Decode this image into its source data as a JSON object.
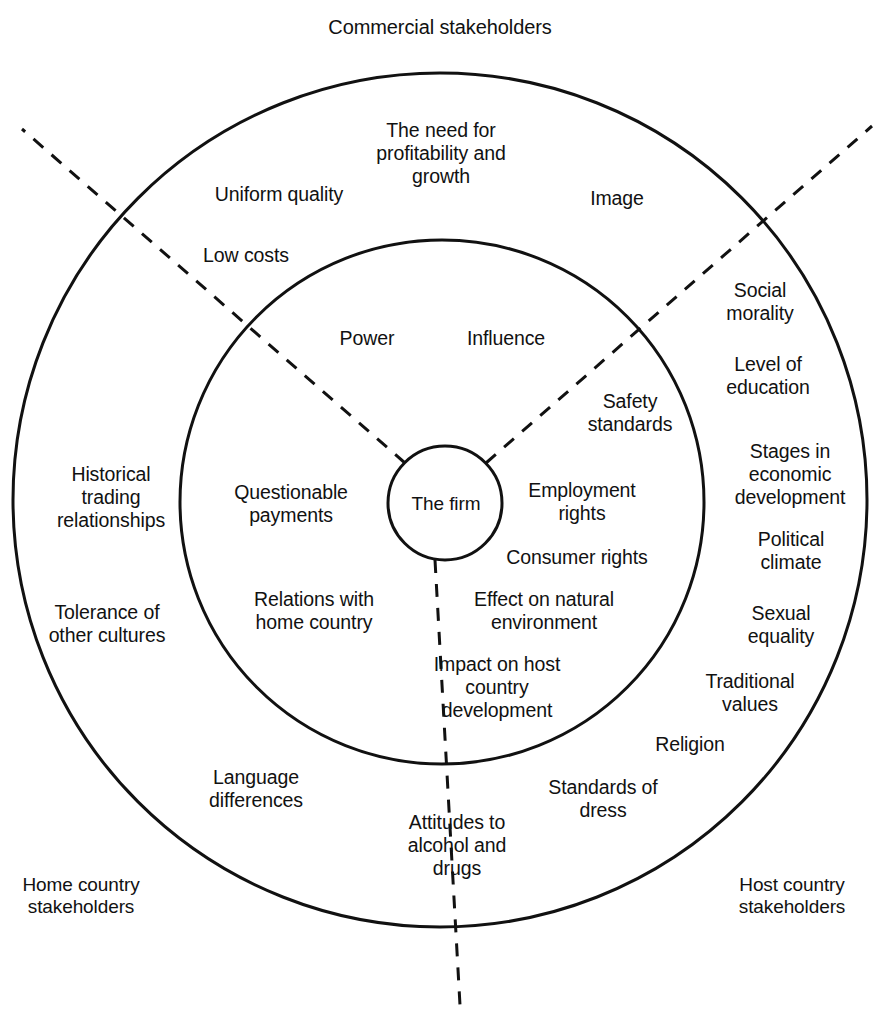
{
  "diagram": {
    "title": "Commercial stakeholders",
    "core_label": "The firm",
    "corner_labels": {
      "home": "Home country\nstakeholders",
      "host": "Host country\nstakeholders"
    },
    "rings": {
      "outer_label": "Commercial stakeholders",
      "stroke_color": "#111111",
      "fill_color": "#ffffff",
      "divider_style": "dashed"
    },
    "inner_ring_items": [
      {
        "id": "power",
        "text": "Power"
      },
      {
        "id": "influence",
        "text": "Influence"
      },
      {
        "id": "questionable-payments",
        "text": "Questionable\npayments"
      },
      {
        "id": "employment-rights",
        "text": "Employment\nrights"
      },
      {
        "id": "consumer-rights",
        "text": "Consumer rights"
      },
      {
        "id": "relations-with-home-country",
        "text": "Relations with\nhome country"
      },
      {
        "id": "effect-on-natural-environment",
        "text": "Effect on natural\nenvironment"
      },
      {
        "id": "impact-on-host-country-development",
        "text": "Impact on host\ncountry\ndevelopment"
      }
    ],
    "outer_ring_items": [
      {
        "id": "the-need-for-profitability-and-growth",
        "text": "The need for\nprofitability and\ngrowth"
      },
      {
        "id": "uniform-quality",
        "text": "Uniform quality"
      },
      {
        "id": "image",
        "text": "Image"
      },
      {
        "id": "low-costs",
        "text": "Low costs"
      },
      {
        "id": "social-morality",
        "text": "Social\nmorality"
      },
      {
        "id": "level-of-education",
        "text": "Level of\neducation"
      },
      {
        "id": "safety-standards",
        "text": "Safety\nstandards"
      },
      {
        "id": "stages-in-economic-development",
        "text": "Stages in\neconomic\ndevelopment"
      },
      {
        "id": "historical-trading-relationships",
        "text": "Historical\ntrading\nrelationships"
      },
      {
        "id": "political-climate",
        "text": "Political\nclimate"
      },
      {
        "id": "sexual-equality",
        "text": "Sexual\nequality"
      },
      {
        "id": "tolerance-of-other-cultures",
        "text": "Tolerance of\nother cultures"
      },
      {
        "id": "traditional-values",
        "text": "Traditional\nvalues"
      },
      {
        "id": "religion",
        "text": "Religion"
      },
      {
        "id": "language-differences",
        "text": "Language\ndifferences"
      },
      {
        "id": "standards-of-dress",
        "text": "Standards of\ndress"
      },
      {
        "id": "attitudes-to-alcohol-and-drugs",
        "text": "Attitudes to\nalcohol and\ndrugs"
      }
    ]
  }
}
